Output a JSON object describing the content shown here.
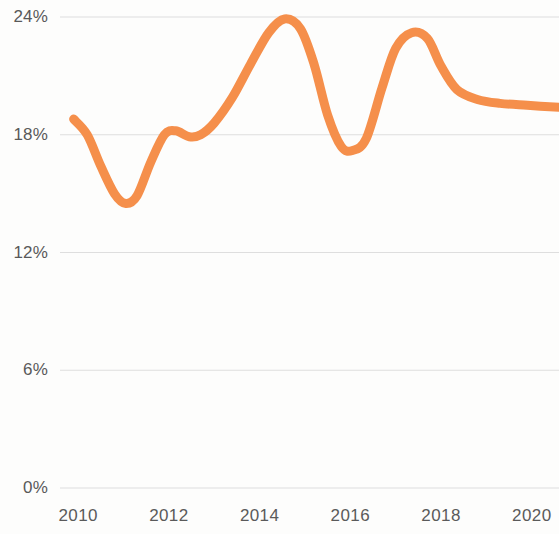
{
  "chart_data": {
    "type": "line",
    "title": "",
    "subtitle": "",
    "xlabel": "",
    "ylabel": "",
    "grid": true,
    "legend": "none",
    "line_color": "#f58f4b",
    "line_width_px": 9,
    "xlim": [
      2009.6,
      2020.6
    ],
    "ylim": [
      0,
      24
    ],
    "y_ticks": [
      {
        "value": 24,
        "label": "24%"
      },
      {
        "value": 18,
        "label": "18%"
      },
      {
        "value": 12,
        "label": "12%"
      },
      {
        "value": 6,
        "label": "6%"
      },
      {
        "value": 0,
        "label": "0%"
      }
    ],
    "x_ticks": [
      {
        "value": 2010,
        "label": "2010"
      },
      {
        "value": 2012,
        "label": "2012"
      },
      {
        "value": 2014,
        "label": "2014"
      },
      {
        "value": 2016,
        "label": "2016"
      },
      {
        "value": 2018,
        "label": "2018"
      },
      {
        "value": 2020,
        "label": "2020"
      }
    ],
    "series": [
      {
        "name": "Series 1",
        "color": "#f58f4b",
        "x": [
          2009.9,
          2010.2,
          2010.5,
          2010.8,
          2011.05,
          2011.3,
          2011.6,
          2011.9,
          2012.15,
          2012.45,
          2012.7,
          2013.0,
          2013.4,
          2013.8,
          2014.2,
          2014.55,
          2014.9,
          2015.2,
          2015.5,
          2015.8,
          2016.05,
          2016.35,
          2016.7,
          2017.0,
          2017.35,
          2017.7,
          2018.0,
          2018.35,
          2018.8,
          2019.3,
          2019.9,
          2020.6
        ],
        "y": [
          18.8,
          18.0,
          16.4,
          15.0,
          14.5,
          14.9,
          16.6,
          18.0,
          18.2,
          17.9,
          18.0,
          18.6,
          19.9,
          21.6,
          23.2,
          23.9,
          23.4,
          21.6,
          19.0,
          17.4,
          17.2,
          17.8,
          20.4,
          22.4,
          23.2,
          22.9,
          21.5,
          20.3,
          19.8,
          19.6,
          19.5,
          19.4
        ]
      }
    ],
    "annotations": [
      {
        "label": "peak",
        "x": 2014.55,
        "y": 23.9
      },
      {
        "label": "first-trough",
        "x": 2011.05,
        "y": 14.5
      },
      {
        "label": "second-trough",
        "x": 2016.05,
        "y": 17.2
      }
    ]
  },
  "axes": {
    "y_labels": [
      "24%",
      "18%",
      "12%",
      "6%",
      "0%"
    ],
    "x_labels": [
      "2010",
      "2012",
      "2014",
      "2016",
      "2018",
      "2020"
    ]
  }
}
